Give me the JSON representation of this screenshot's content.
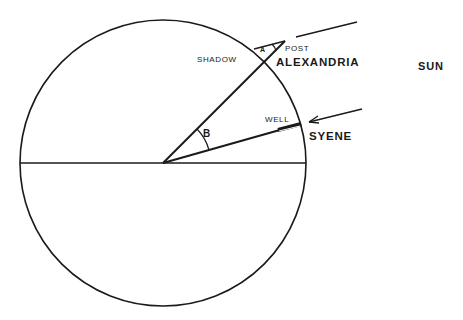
{
  "diagram": {
    "labels": {
      "shadow": "SHADOW",
      "post": "POST",
      "angle_a": "A",
      "alexandria": "ALEXANDRIA",
      "sun": "SUN",
      "well": "WELL",
      "angle_b": "B",
      "syene": "SYENE"
    },
    "colors": {
      "ink": "#1a1a1a",
      "background": "#ffffff"
    }
  }
}
